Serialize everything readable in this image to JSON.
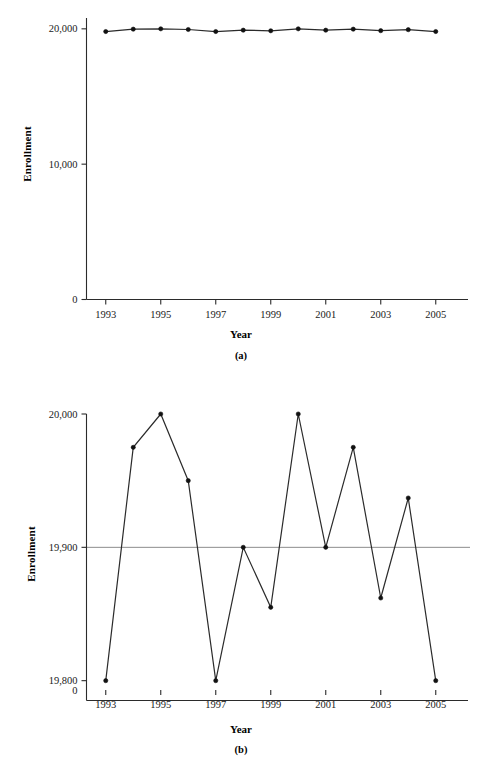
{
  "figure": {
    "panel_a": {
      "caption": "(a)",
      "xlabel": "Year",
      "ylabel": "Enrollment"
    },
    "panel_b": {
      "caption": "(b)",
      "xlabel": "Year",
      "ylabel": "Enrollment"
    }
  },
  "chart_data": [
    {
      "type": "line",
      "panel": "(a)",
      "title": "",
      "xlabel": "Year",
      "ylabel": "Enrollment",
      "x": [
        1993,
        1994,
        1995,
        1996,
        1997,
        1998,
        1999,
        2000,
        2001,
        2002,
        2003,
        2004,
        2005
      ],
      "values": [
        19800,
        19975,
        20000,
        19950,
        19800,
        19900,
        19855,
        20000,
        19900,
        19975,
        19862,
        19937,
        19800
      ],
      "xtick_labels": [
        "1993",
        "1995",
        "1997",
        "1999",
        "2001",
        "2003",
        "2005"
      ],
      "xticks": [
        1993,
        1995,
        1997,
        1999,
        2001,
        2003,
        2005
      ],
      "ytick_labels": [
        "0",
        "10,000",
        "20,000"
      ],
      "yticks": [
        0,
        10000,
        20000
      ],
      "ylim": [
        0,
        20800
      ],
      "xlim": [
        1992.3,
        2005.7
      ],
      "grid": false,
      "legend": false,
      "marker": "filled-circle",
      "line_color": "#2b2b2b",
      "marker_color": "#111111"
    },
    {
      "type": "line",
      "panel": "(b)",
      "title": "",
      "xlabel": "Year",
      "ylabel": "Enrollment",
      "x": [
        1993,
        1994,
        1995,
        1996,
        1997,
        1998,
        1999,
        2000,
        2001,
        2002,
        2003,
        2004,
        2005
      ],
      "values": [
        19800,
        19975,
        20000,
        19950,
        19800,
        19900,
        19855,
        20000,
        19900,
        19975,
        19862,
        19937,
        19800
      ],
      "xtick_labels": [
        "1993",
        "1995",
        "1997",
        "1999",
        "2001",
        "2003",
        "2005"
      ],
      "xticks": [
        1993,
        1995,
        1997,
        1999,
        2001,
        2003,
        2005
      ],
      "ytick_labels": [
        "19,800",
        "19,900",
        "20,000"
      ],
      "yticks": [
        19800,
        19900,
        20000
      ],
      "y_origin_label": "0",
      "ylim": [
        19793,
        20000
      ],
      "xlim": [
        1992.3,
        2005.7
      ],
      "grid": false,
      "reference_line": {
        "y": 19900,
        "color": "#8c8c8c"
      },
      "legend": false,
      "marker": "filled-circle",
      "line_color": "#2b2b2b",
      "marker_color": "#111111"
    }
  ]
}
